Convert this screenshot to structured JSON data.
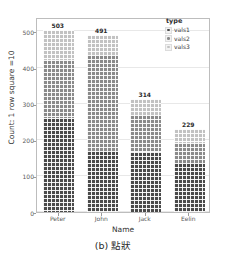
{
  "caption": "(b) 點狀",
  "legend": {
    "title": "type",
    "entries": [
      {
        "label": "vals1",
        "color": "#4a4a4a",
        "key_icon": "dot-square-icon"
      },
      {
        "label": "vals2",
        "color": "#8a8a8a",
        "key_icon": "dot-square-icon"
      },
      {
        "label": "vals3",
        "color": "#c2c2c2",
        "key_icon": "dot-square-icon"
      }
    ]
  },
  "chart_data": {
    "type": "bar",
    "title": "",
    "subtitle": "",
    "xlabel": "Name",
    "ylabel": "Count: 1 row square =10",
    "categories": [
      "Peter",
      "John",
      "Jack",
      "Eelin"
    ],
    "totals": [
      503,
      491,
      314,
      229
    ],
    "total_labels": [
      "503",
      "491",
      "314",
      "229"
    ],
    "stacked": true,
    "series": [
      {
        "name": "vals1",
        "color": "#4a4a4a",
        "values": [
          260,
          170,
          165,
          135
        ]
      },
      {
        "name": "vals2",
        "color": "#8a8a8a",
        "values": [
          160,
          265,
          105,
          55
        ]
      },
      {
        "name": "vals3",
        "color": "#c2c2c2",
        "values": [
          83,
          56,
          44,
          39
        ]
      }
    ],
    "ylim": [
      0,
      540
    ],
    "yticks": [
      0,
      100,
      200,
      300,
      400,
      500
    ],
    "ytick_labels": [
      "0",
      "100",
      "200",
      "300",
      "400",
      "500"
    ],
    "grid": true,
    "legend_position": "top-right",
    "texture": "dotted"
  }
}
